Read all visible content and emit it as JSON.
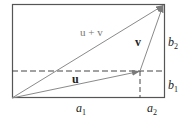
{
  "diagram": {
    "type": "vector-addition",
    "labels": {
      "sum": "u + v",
      "u": "u",
      "v": "v",
      "a1": {
        "base": "a",
        "sub": "1"
      },
      "a2": {
        "base": "a",
        "sub": "2"
      },
      "b1": {
        "base": "b",
        "sub": "1"
      },
      "b2": {
        "base": "b",
        "sub": "2"
      }
    },
    "colors": {
      "frame": "#555555",
      "arrow": "#8a8a8a",
      "dashed": "#444444",
      "text": "#222222"
    }
  }
}
